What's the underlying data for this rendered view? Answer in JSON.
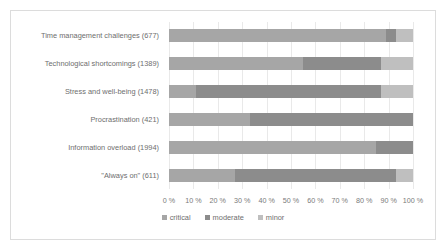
{
  "chart_data": {
    "type": "bar",
    "subtype": "stacked-horizontal-100-percent",
    "title": "",
    "xlabel": "",
    "ylabel": "",
    "xlim": [
      0,
      100
    ],
    "grid": true,
    "legend_position": "bottom",
    "categories": [
      "Time management challenges (677)",
      "Technological shortcomings (1389)",
      "Stress and well-being (1478)",
      "Procrastination (421)",
      "Information overload (1994)",
      "\"Always on\"  (611)"
    ],
    "category_counts": [
      677,
      1389,
      1478,
      421,
      1994,
      611
    ],
    "series": [
      {
        "name": "critical",
        "color": "#a6a6a6",
        "values": [
          89,
          55,
          11,
          33,
          85,
          27
        ]
      },
      {
        "name": "moderate",
        "color": "#8c8c8c",
        "values": [
          4,
          32,
          76,
          67,
          15,
          66
        ]
      },
      {
        "name": "minor",
        "color": "#bfbfbf",
        "values": [
          7,
          13,
          13,
          0,
          0,
          7
        ]
      }
    ],
    "xticks": [
      0,
      10,
      20,
      30,
      40,
      50,
      60,
      70,
      80,
      90,
      100
    ],
    "xticklabels": [
      "0 %",
      "10 %",
      "20 %",
      "30 %",
      "40 %",
      "50 %",
      "60 %",
      "70 %",
      "80 %",
      "90 %",
      "100 %"
    ]
  },
  "legend": {
    "items": [
      {
        "label": "critical",
        "color": "#a6a6a6"
      },
      {
        "label": "moderate",
        "color": "#8c8c8c"
      },
      {
        "label": "minor",
        "color": "#bfbfbf"
      }
    ]
  },
  "frame": {
    "border_color": "#dcdcdc",
    "background": "#ffffff",
    "gridline_color": "#e9e9e9"
  }
}
